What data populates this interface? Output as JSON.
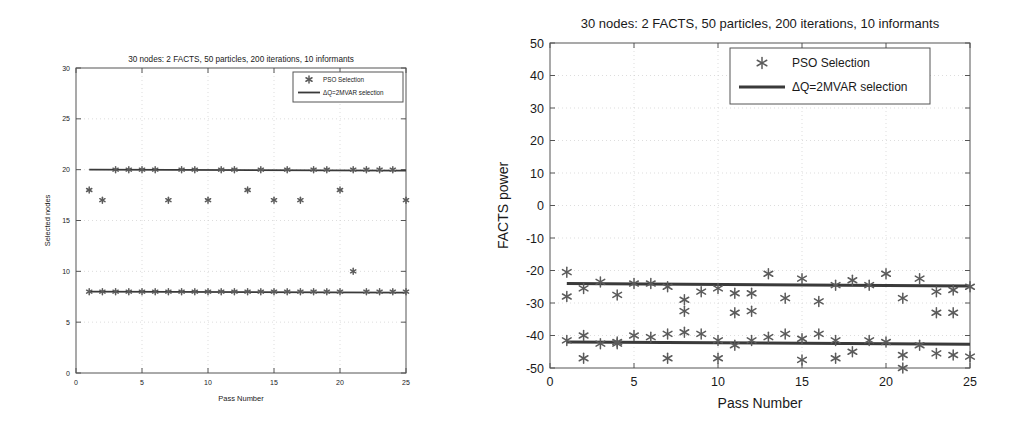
{
  "figure": {
    "panel_count": 2
  },
  "chart_data": [
    {
      "id": "left",
      "type": "scatter",
      "title": "30 nodes: 2 FACTS, 50 particles, 200 iterations, 10 informants",
      "xlabel": "Pass Number",
      "ylabel": "Selected nodes",
      "xlim": [
        0,
        25
      ],
      "ylim": [
        0,
        30
      ],
      "xticks": [
        0,
        5,
        10,
        15,
        20,
        25
      ],
      "yticks": [
        0,
        5,
        10,
        15,
        20,
        25,
        30
      ],
      "grid": true,
      "legend": {
        "position": "top-right",
        "entries": [
          {
            "label": "PSO Selection",
            "marker": "asterisk",
            "color": "#5b5b5b"
          },
          {
            "label": "ΔQ=2MVAR selection",
            "marker": "line",
            "color": "#3a3a3a"
          }
        ]
      },
      "x": [
        1,
        2,
        3,
        4,
        5,
        6,
        7,
        8,
        9,
        10,
        11,
        12,
        13,
        14,
        15,
        16,
        17,
        18,
        19,
        20,
        21,
        22,
        23,
        24,
        25
      ],
      "series": [
        {
          "name": "PSO Selection (upper node)",
          "marker": "asterisk",
          "values": [
            18,
            17,
            20,
            20,
            20,
            20,
            17,
            20,
            20,
            17,
            20,
            20,
            18,
            20,
            17,
            20,
            17,
            20,
            20,
            18,
            20,
            20,
            20,
            20,
            17
          ]
        },
        {
          "name": "PSO Selection (lower node)",
          "marker": "asterisk",
          "values": [
            8,
            8,
            8,
            8,
            8,
            8,
            8,
            8,
            8,
            8,
            8,
            8,
            8,
            8,
            8,
            8,
            8,
            8,
            8,
            8,
            10,
            8,
            8,
            8,
            8
          ]
        }
      ],
      "trendlines": [
        {
          "name": "ΔQ=2MVAR selection (upper)",
          "y_start": 20,
          "y_end": 19.9
        },
        {
          "name": "ΔQ=2MVAR selection (lower)",
          "y_start": 8,
          "y_end": 7.9
        }
      ]
    },
    {
      "id": "right",
      "type": "scatter",
      "title": "30 nodes: 2 FACTS, 50 particles, 200 iterations, 10 informants",
      "xlabel": "Pass Number",
      "ylabel": "FACTS power",
      "xlim": [
        0,
        25
      ],
      "ylim": [
        -50,
        50
      ],
      "xticks": [
        0,
        5,
        10,
        15,
        20,
        25
      ],
      "yticks": [
        -50,
        -40,
        -30,
        -20,
        -10,
        0,
        10,
        20,
        30,
        40,
        50
      ],
      "grid": true,
      "legend": {
        "position": "top-right",
        "entries": [
          {
            "label": "PSO Selection",
            "marker": "asterisk",
            "color": "#5b5b5b"
          },
          {
            "label": "ΔQ=2MVAR selection",
            "marker": "line",
            "color": "#3a3a3a"
          }
        ]
      },
      "x": [
        1,
        2,
        3,
        4,
        5,
        6,
        7,
        8,
        9,
        10,
        11,
        12,
        13,
        14,
        15,
        16,
        17,
        18,
        19,
        20,
        21,
        22,
        23,
        24,
        25
      ],
      "series": [
        {
          "name": "PSO Selection (upper node)",
          "marker": "asterisk",
          "values": [
            -20.5,
            -25.5,
            -23.5,
            -27.5,
            -24,
            -24,
            -25,
            -29,
            -26.5,
            -25.5,
            -27,
            -27,
            -21,
            -28.5,
            -22.5,
            -29.5,
            -24.5,
            -23,
            -24.5,
            -21,
            -28.5,
            -22.5,
            -26.5,
            -26,
            -25
          ]
        },
        {
          "name": "PSO Selection (upper node, secondary)",
          "marker": "asterisk",
          "values": [
            -28,
            null,
            null,
            -42.5,
            null,
            null,
            null,
            -32.5,
            null,
            null,
            -33,
            -32.5,
            null,
            null,
            null,
            null,
            null,
            null,
            null,
            null,
            null,
            null,
            -33,
            -33,
            null
          ]
        },
        {
          "name": "PSO Selection (lower node)",
          "marker": "asterisk",
          "values": [
            -41.5,
            -40,
            -42.5,
            -42,
            -40,
            -40.5,
            -39.5,
            -39,
            -39.5,
            -41.5,
            -43,
            -41.5,
            -40.5,
            -39.5,
            -41,
            -39.5,
            -41.5,
            -45,
            -41.5,
            -42,
            -50,
            -43,
            -45.5,
            -46,
            -46.5
          ]
        },
        {
          "name": "PSO Selection (lower node, secondary)",
          "marker": "asterisk",
          "values": [
            null,
            -47,
            null,
            null,
            null,
            null,
            -47,
            null,
            null,
            -47,
            null,
            null,
            null,
            null,
            -47.5,
            null,
            -47,
            null,
            null,
            null,
            -46,
            null,
            null,
            null,
            null
          ]
        }
      ],
      "trendlines": [
        {
          "name": "ΔQ=2MVAR selection (upper)",
          "y_start": -24,
          "y_end": -24.8
        },
        {
          "name": "ΔQ=2MVAR selection (lower)",
          "y_start": -42,
          "y_end": -42.7
        }
      ]
    }
  ]
}
